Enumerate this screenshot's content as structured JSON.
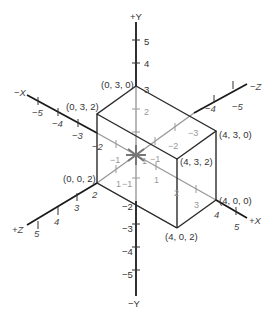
{
  "axes": {
    "pos_y": "+Y",
    "neg_y": "−Y",
    "pos_x": "+X",
    "neg_x": "−X",
    "pos_z": "+Z",
    "neg_z": "−Z"
  },
  "y_ticks_upper": [
    "1",
    "2",
    "3",
    "4",
    "5"
  ],
  "y_ticks_lower": [
    "−1",
    "−2",
    "−3",
    "−4",
    "−5"
  ],
  "x_ticks_pos": [
    "1",
    "2",
    "3",
    "4",
    "5"
  ],
  "x_ticks_neg": [
    "−1",
    "−2",
    "−3",
    "−4",
    "−5"
  ],
  "z_ticks_pos": [
    "1",
    "2",
    "3",
    "4",
    "5"
  ],
  "z_ticks_neg": [
    "−1",
    "−2",
    "−3",
    "−4",
    "−5"
  ],
  "vertices": {
    "v030": "(0, 3, 0)",
    "v032": "(0, 3, 2)",
    "v002": "(0, 0, 2)",
    "v430": "(4, 3, 0)",
    "v432": "(4, 3, 2)",
    "v400": "(4, 0, 0)",
    "v402": "(4, 0, 2)"
  },
  "colors": {
    "axis": "#1a1a1a",
    "hidden": "#9a9a9a",
    "background": "#ffffff"
  }
}
